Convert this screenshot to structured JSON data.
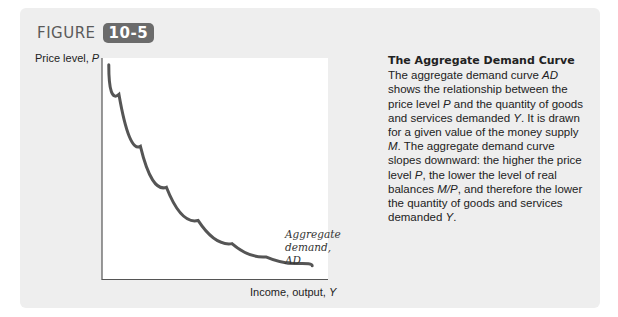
{
  "figure": {
    "word": "FIGURE",
    "number": "10-5",
    "badge_color": "#6b6b6b"
  },
  "caption": {
    "title": "The Aggregate Demand Curve",
    "body_parts": [
      {
        "t": " The aggregate demand curve ",
        "i": false
      },
      {
        "t": "AD",
        "i": true
      },
      {
        "t": " shows the relationship between the price level ",
        "i": false
      },
      {
        "t": "P",
        "i": true
      },
      {
        "t": " and the quantity of goods and services demanded ",
        "i": false
      },
      {
        "t": "Y",
        "i": true
      },
      {
        "t": ". It is drawn for a given value of the money supply ",
        "i": false
      },
      {
        "t": "M",
        "i": true
      },
      {
        "t": ". The aggregate demand curve slopes downward: the higher the price level ",
        "i": false
      },
      {
        "t": "P",
        "i": true
      },
      {
        "t": ", the lower the level of real balances ",
        "i": false
      },
      {
        "t": "M/P",
        "i": true
      },
      {
        "t": ", and therefore the lower the quantity of goods and services demanded ",
        "i": false
      },
      {
        "t": "Y",
        "i": true
      },
      {
        "t": ".",
        "i": false
      }
    ]
  },
  "chart_data": {
    "type": "line",
    "title": "The Aggregate Demand Curve",
    "xlabel": "Income, output, Y",
    "ylabel": "Price level, P",
    "grid": false,
    "ticks": "none",
    "series": [
      {
        "name": "Aggregate demand, AD",
        "shape": "downward-sloping convex curve (rectangular hyperbola)",
        "points_normalized": [
          [
            0.03,
            0.97
          ],
          [
            0.12,
            0.7
          ],
          [
            0.22,
            0.5
          ],
          [
            0.35,
            0.33
          ],
          [
            0.5,
            0.2
          ],
          [
            0.65,
            0.12
          ],
          [
            0.8,
            0.08
          ],
          [
            0.93,
            0.06
          ]
        ],
        "color": "#555555"
      }
    ],
    "annotations": [
      {
        "text": "Aggregate demand, AD",
        "position": "end of curve, lower right"
      }
    ],
    "x_label_parts": {
      "text": "Income, output, ",
      "var": "Y"
    },
    "y_label_parts": {
      "text": "Price level, ",
      "var": "P"
    },
    "curve_label_lines": [
      "Aggregate",
      "demand,",
      "AD"
    ]
  }
}
